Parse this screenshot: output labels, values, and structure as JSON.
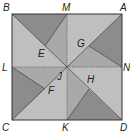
{
  "diagram": {
    "type": "geometric-square-pinwheel",
    "colors": {
      "dark": "#8c8c8c",
      "medium": "#a9a9a9",
      "light": "#bfbfbf",
      "stroke": "#444444",
      "dotted": "#555555"
    },
    "points": {
      "A": {
        "label": "A",
        "x": 122,
        "y": 14
      },
      "B": {
        "label": "B",
        "x": 12,
        "y": 14
      },
      "C": {
        "label": "C",
        "x": 12,
        "y": 120
      },
      "D": {
        "label": "D",
        "x": 122,
        "y": 120
      },
      "M": {
        "label": "M",
        "x": 67,
        "y": 14
      },
      "N": {
        "label": "N",
        "x": 122,
        "y": 67
      },
      "K": {
        "label": "K",
        "x": 67,
        "y": 120
      },
      "L": {
        "label": "L",
        "x": 12,
        "y": 67
      },
      "J": {
        "label": "J",
        "x": 67,
        "y": 67
      },
      "E": {
        "label": "E",
        "x": 45,
        "y": 46
      },
      "G": {
        "label": "G",
        "x": 89,
        "y": 46
      },
      "F": {
        "label": "F",
        "x": 45,
        "y": 89
      },
      "H": {
        "label": "H",
        "x": 89,
        "y": 89
      }
    },
    "labels": {
      "A": "A",
      "B": "B",
      "C": "C",
      "D": "D",
      "M": "M",
      "N": "N",
      "K": "K",
      "L": "L",
      "J": "J",
      "E": "E",
      "F": "F",
      "G": "G",
      "H": "H"
    }
  }
}
